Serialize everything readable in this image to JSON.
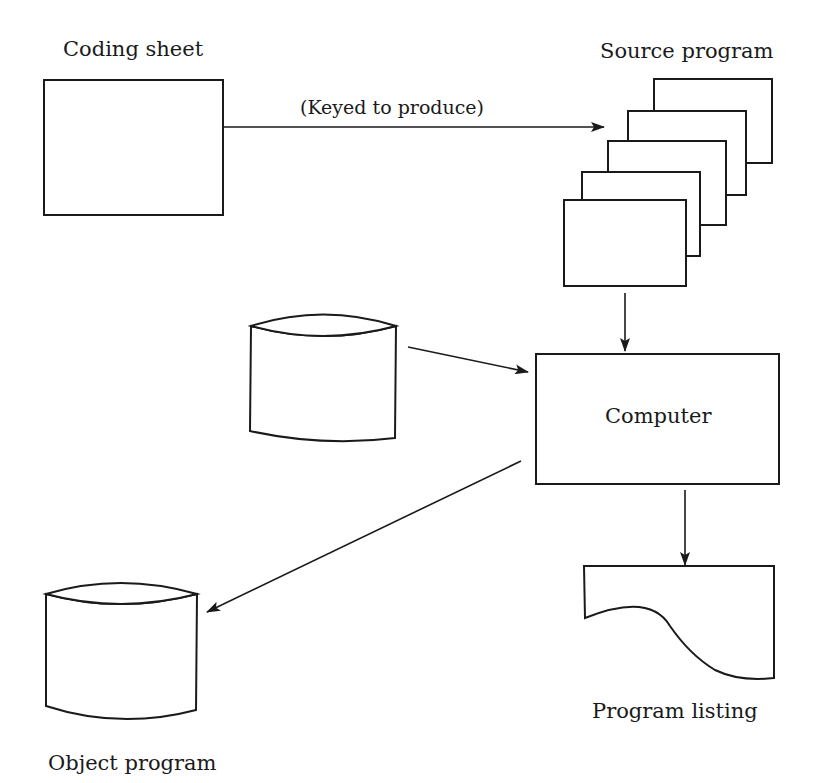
{
  "diagram": {
    "nodes": {
      "coding_sheet": {
        "label": "Coding sheet",
        "shape": "rectangle"
      },
      "source_program": {
        "label": "Source program",
        "shape": "card-stack",
        "cards": 5
      },
      "input_disk": {
        "label": "",
        "shape": "cylinder"
      },
      "computer": {
        "label": "Computer",
        "shape": "rectangle"
      },
      "object_program": {
        "label": "Object program",
        "shape": "cylinder"
      },
      "program_listing": {
        "label": "Program listing",
        "shape": "document"
      }
    },
    "edges": [
      {
        "from": "coding_sheet",
        "to": "source_program",
        "label": "(Keyed to produce)"
      },
      {
        "from": "source_program",
        "to": "computer",
        "label": ""
      },
      {
        "from": "input_disk",
        "to": "computer",
        "label": ""
      },
      {
        "from": "computer",
        "to": "object_program",
        "label": ""
      },
      {
        "from": "computer",
        "to": "program_listing",
        "label": ""
      }
    ]
  },
  "colors": {
    "ink": "#1a1a1a",
    "background": "#ffffff"
  }
}
